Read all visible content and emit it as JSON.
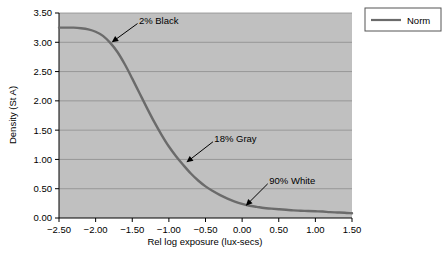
{
  "chart_data": {
    "type": "line",
    "title": "",
    "xlabel": "Rel log exposure (lux-secs)",
    "ylabel": "Density (St A)",
    "xlim": [
      -2.5,
      1.5
    ],
    "ylim": [
      0.0,
      3.5
    ],
    "grid": "horizontal",
    "plot_background": "#c0c0c0",
    "line_color": "#6b6b6b",
    "legend_position": "outside-top-right",
    "xticks": [
      "-2.50",
      "-2.00",
      "-1.50",
      "-1.00",
      "-0.50",
      "0.00",
      "0.50",
      "1.00",
      "1.50"
    ],
    "xtick_values": [
      -2.5,
      -2.0,
      -1.5,
      -1.0,
      -0.5,
      0.0,
      0.5,
      1.0,
      1.5
    ],
    "yticks": [
      "0.00",
      "0.50",
      "1.00",
      "1.50",
      "2.00",
      "2.50",
      "3.00",
      "3.50"
    ],
    "ytick_values": [
      0.0,
      0.5,
      1.0,
      1.5,
      2.0,
      2.5,
      3.0,
      3.5
    ],
    "series": [
      {
        "name": "Norm",
        "x": [
          -2.5,
          -2.4,
          -2.3,
          -2.2,
          -2.1,
          -2.0,
          -1.9,
          -1.8,
          -1.7,
          -1.6,
          -1.5,
          -1.4,
          -1.3,
          -1.2,
          -1.1,
          -1.0,
          -0.9,
          -0.8,
          -0.7,
          -0.6,
          -0.5,
          -0.4,
          -0.3,
          -0.2,
          -0.1,
          0.0,
          0.1,
          0.2,
          0.3,
          0.4,
          0.5,
          0.6,
          0.7,
          0.8,
          0.9,
          1.0,
          1.1,
          1.2,
          1.3,
          1.4,
          1.5
        ],
        "values": [
          3.25,
          3.25,
          3.25,
          3.24,
          3.22,
          3.18,
          3.11,
          2.99,
          2.83,
          2.62,
          2.38,
          2.13,
          1.88,
          1.64,
          1.42,
          1.22,
          1.05,
          0.9,
          0.76,
          0.64,
          0.54,
          0.46,
          0.39,
          0.33,
          0.28,
          0.24,
          0.21,
          0.19,
          0.17,
          0.16,
          0.15,
          0.14,
          0.13,
          0.125,
          0.12,
          0.115,
          0.11,
          0.1,
          0.095,
          0.09,
          0.08
        ]
      }
    ],
    "annotations": [
      {
        "label": "2% Black",
        "point_x": -1.78,
        "point_y": 3.0,
        "text_x": -1.45,
        "text_y": 3.3
      },
      {
        "label": "18% Gray",
        "point_x": -0.76,
        "point_y": 0.95,
        "text_x": -0.42,
        "text_y": 1.28
      },
      {
        "label": "90% White",
        "point_x": 0.05,
        "point_y": 0.21,
        "text_x": 0.33,
        "text_y": 0.56
      }
    ],
    "legend": [
      {
        "label": "Norm",
        "color": "#6b6b6b"
      }
    ]
  }
}
